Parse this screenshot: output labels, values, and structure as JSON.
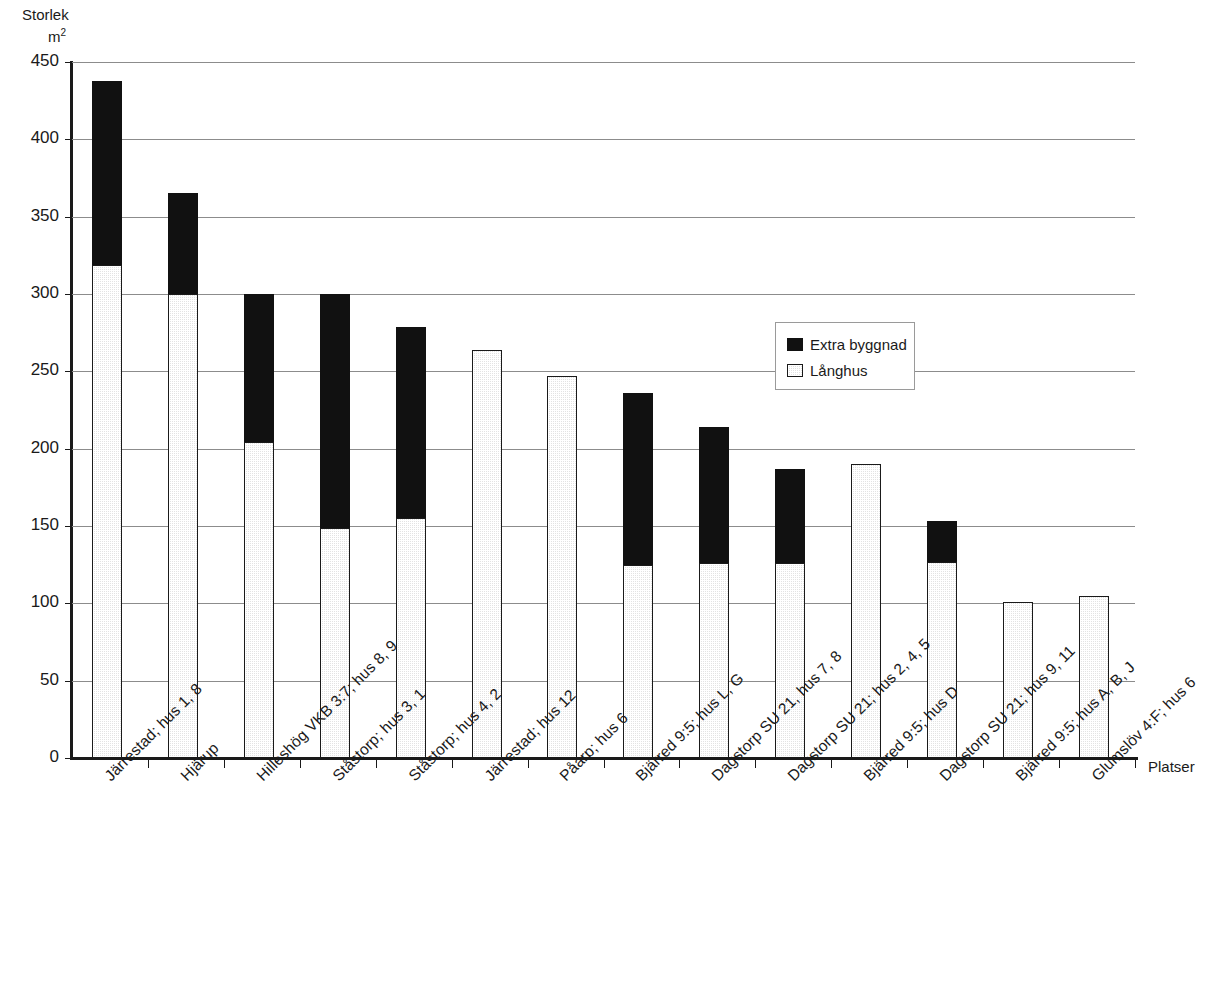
{
  "chart_data": {
    "type": "bar",
    "stacked": true,
    "title": "",
    "ylabel": "Storlek",
    "yunit": "m2",
    "xlabel": "Platser",
    "ylim": [
      0,
      450
    ],
    "ytick_step": 50,
    "yticks": [
      "450",
      "400",
      "350",
      "300",
      "250",
      "200",
      "150",
      "100",
      "50",
      "0"
    ],
    "ytick_values": [
      450,
      400,
      350,
      300,
      250,
      200,
      150,
      100,
      50,
      0
    ],
    "grid": true,
    "legend_position": "inside-upper-right",
    "categories": [
      "Järrestad; hus 1, 8",
      "Hjärup",
      "Hilleshög VKB 3:7; hus 8, 9",
      "Ståstorp; hus 3, 1",
      "Ståstorp; hus 4, 2",
      "Järrestad; hus 12",
      "Påarp; hus 6",
      "Bjärred 9:5; hus L, G",
      "Dagstorp SU 21, hus 7, 8",
      "Dagstorp SU 21; hus 2, 4, 5",
      "Bjärred 9:5; hus D",
      "Dagstorp SU 21; hus 9, 11",
      "Bjärred 9:5; hus A, B, J",
      "Glumslöv 4:F; hus 6"
    ],
    "series": [
      {
        "name": "Långhus",
        "color": "#e3e3e3",
        "values": [
          319,
          300,
          204,
          149,
          155,
          264,
          247,
          125,
          126,
          126,
          190,
          127,
          101,
          105
        ]
      },
      {
        "name": "Extra byggnad",
        "color": "#111111",
        "values": [
          119,
          65,
          96,
          151,
          124,
          0,
          0,
          111,
          88,
          61,
          0,
          26,
          0,
          0
        ]
      }
    ],
    "totals": [
      438,
      365,
      300,
      300,
      279,
      264,
      247,
      236,
      214,
      187,
      190,
      153,
      101,
      105
    ]
  },
  "legend": {
    "items": [
      {
        "label": "Extra byggnad",
        "swatch": "black-square-icon"
      },
      {
        "label": "Långhus",
        "swatch": "gray-square-icon"
      }
    ]
  },
  "axes": {
    "y_title_line1": "Storlek",
    "y_title_line2": "m2",
    "x_title": "Platser"
  }
}
